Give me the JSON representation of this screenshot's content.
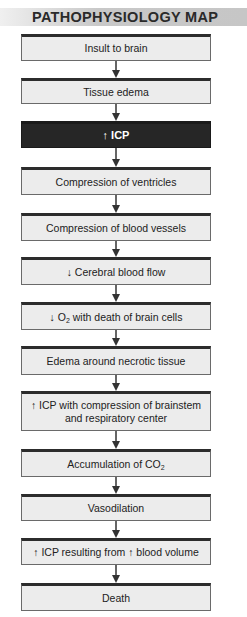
{
  "header": {
    "title": "PATHOPHYSIOLOGY MAP"
  },
  "colors": {
    "box_fill": "#ececec",
    "highlight_fill": "#262626",
    "header_band": "#c8c8c8",
    "arrow": "#333333"
  },
  "steps": [
    {
      "id": "insult",
      "text": "Insult to brain",
      "top": 34,
      "height": 27,
      "highlight": false
    },
    {
      "id": "tissue-edema",
      "text": "Tissue edema",
      "top": 78,
      "height": 26,
      "highlight": false
    },
    {
      "id": "icp",
      "pre": "↑ ",
      "text": "ICP",
      "top": 121,
      "height": 27,
      "highlight": true
    },
    {
      "id": "compression-ventricles",
      "text": "Compression of ventricles",
      "top": 167,
      "height": 28,
      "highlight": false
    },
    {
      "id": "compression-vessels",
      "text": "Compression of blood vessels",
      "top": 213,
      "height": 28,
      "highlight": false
    },
    {
      "id": "cerebral-blood-flow",
      "pre": "↓ ",
      "text": "Cerebral blood flow",
      "top": 257,
      "height": 28,
      "highlight": false
    },
    {
      "id": "o2-death",
      "pre": "↓ O",
      "sub": "2",
      "text": " with death of brain cells",
      "top": 302,
      "height": 28,
      "highlight": false
    },
    {
      "id": "edema-necrotic",
      "text": "Edema around necrotic tissue",
      "top": 346,
      "height": 29,
      "highlight": false
    },
    {
      "id": "icp-brainstem",
      "pre": "↑ ",
      "text": "ICP with compression of brainstem",
      "line2": "and respiratory center",
      "top": 391,
      "height": 40,
      "highlight": false
    },
    {
      "id": "co2",
      "pre": "Accumulation of CO",
      "sub": "2",
      "text": "",
      "top": 449,
      "height": 28,
      "highlight": false
    },
    {
      "id": "vasodilation",
      "text": "Vasodilation",
      "top": 494,
      "height": 27,
      "highlight": false
    },
    {
      "id": "icp-blood-volume",
      "pre": "↑ ",
      "text": "ICP resulting from ↑ blood volume",
      "top": 538,
      "height": 27,
      "highlight": false
    },
    {
      "id": "death",
      "text": "Death",
      "top": 583,
      "height": 28,
      "highlight": false
    }
  ],
  "arrows": [
    {
      "top": 61,
      "height": 17
    },
    {
      "top": 104,
      "height": 17
    },
    {
      "top": 148,
      "height": 19
    },
    {
      "top": 195,
      "height": 18
    },
    {
      "top": 241,
      "height": 16
    },
    {
      "top": 285,
      "height": 17
    },
    {
      "top": 330,
      "height": 16
    },
    {
      "top": 375,
      "height": 16
    },
    {
      "top": 431,
      "height": 18
    },
    {
      "top": 477,
      "height": 17
    },
    {
      "top": 521,
      "height": 17
    },
    {
      "top": 565,
      "height": 18
    }
  ]
}
